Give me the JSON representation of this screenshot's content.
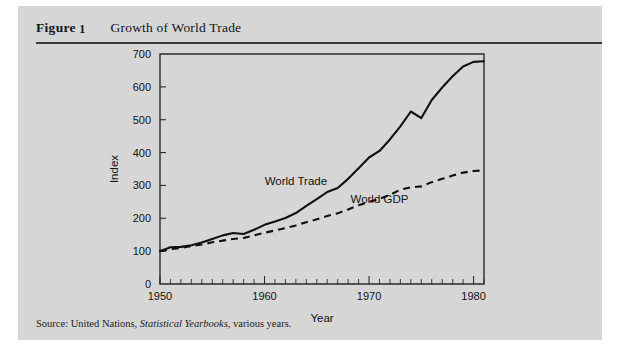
{
  "figure": {
    "label": "Figure",
    "number": "1",
    "title": "Growth of World Trade",
    "source_prefix": "Source: United Nations,",
    "source_italic": "Statistical Yearbooks",
    "source_suffix": ", various years."
  },
  "colors": {
    "panel_background": "#d6d6d6",
    "page_background": "#ffffff",
    "ink": "#101010",
    "rule": "#3a3a3a"
  },
  "chart_data": {
    "type": "line",
    "title": "Growth of World Trade",
    "xlabel": "Year",
    "ylabel": "Index",
    "xlim": [
      1950,
      1981
    ],
    "ylim": [
      0,
      700
    ],
    "yticks": [
      0,
      100,
      200,
      300,
      400,
      500,
      600,
      700
    ],
    "ytick_labels": [
      "0",
      "100",
      "200",
      "300",
      "400",
      "500",
      "600",
      "700"
    ],
    "xticks": [
      1950,
      1960,
      1970,
      1980
    ],
    "xtick_labels": [
      "1950",
      "1960",
      "1970",
      "1980"
    ],
    "x_minor_tick_step": 1,
    "grid": false,
    "legend": "inline-labels",
    "x": [
      1950,
      1951,
      1952,
      1953,
      1954,
      1955,
      1956,
      1957,
      1958,
      1959,
      1960,
      1961,
      1962,
      1963,
      1964,
      1965,
      1966,
      1967,
      1968,
      1969,
      1970,
      1971,
      1972,
      1973,
      1974,
      1975,
      1976,
      1977,
      1978,
      1979,
      1980,
      1981
    ],
    "series": [
      {
        "name": "World Trade",
        "style": "solid",
        "label_x": 1963,
        "label_y": 300,
        "values": [
          100,
          112,
          113,
          118,
          126,
          137,
          148,
          155,
          152,
          165,
          180,
          190,
          201,
          216,
          238,
          258,
          280,
          292,
          320,
          352,
          385,
          405,
          440,
          480,
          525,
          505,
          560,
          598,
          632,
          662,
          676,
          678
        ]
      },
      {
        "name": "World GDP",
        "style": "dashed",
        "label_x": 1971,
        "label_y": 248,
        "values": [
          100,
          106,
          110,
          115,
          120,
          127,
          132,
          137,
          140,
          148,
          156,
          163,
          170,
          178,
          188,
          197,
          207,
          215,
          227,
          240,
          250,
          259,
          271,
          287,
          294,
          297,
          310,
          320,
          330,
          339,
          344,
          346
        ]
      }
    ]
  }
}
